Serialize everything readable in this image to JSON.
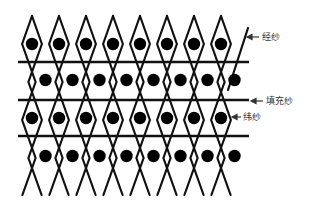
{
  "diagram": {
    "type": "woven fabric structure schematic",
    "colors": {
      "line": "#111111",
      "dot": "#000000",
      "label": "#333333",
      "background": "#ffffff"
    },
    "labels": {
      "warp": "经纱",
      "filler": "填充纱",
      "weft": "纬纱"
    },
    "rows_of_dots": 4,
    "dots_per_row": 8,
    "horizontal_lines": 3
  }
}
